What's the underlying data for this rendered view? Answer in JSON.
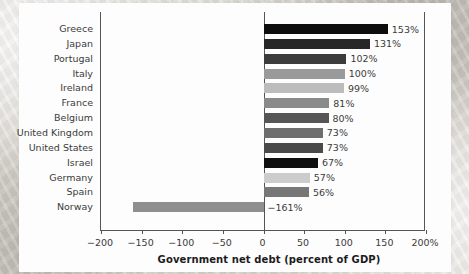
{
  "chart_data": {
    "type": "bar",
    "orientation": "horizontal",
    "title": "",
    "xlabel": "Government net debt (percent of GDP)",
    "ylabel": "",
    "xlim": [
      -200,
      200
    ],
    "xticks": [
      -200,
      -150,
      -100,
      -50,
      0,
      50,
      100,
      150,
      200
    ],
    "xtick_labels": [
      "−200",
      "−150",
      "−100",
      "−50",
      "0",
      "50",
      "100",
      "150",
      "200%"
    ],
    "grid": false,
    "legend": "none",
    "categories": [
      "Greece",
      "Japan",
      "Portugal",
      "Italy",
      "Ireland",
      "France",
      "Belgium",
      "United Kingdom",
      "United States",
      "Israel",
      "Germany",
      "Spain",
      "Norway"
    ],
    "values": [
      153,
      131,
      102,
      100,
      99,
      81,
      80,
      73,
      73,
      67,
      57,
      56,
      -161
    ],
    "value_labels": [
      "153%",
      "131%",
      "102%",
      "100%",
      "99%",
      "81%",
      "80%",
      "73%",
      "73%",
      "67%",
      "57%",
      "56%",
      "−161%"
    ],
    "bar_colors": [
      "#0d0d0d",
      "#272727",
      "#3c3c3c",
      "#9a9a9a",
      "#bcbcbc",
      "#8a8a8a",
      "#565656",
      "#6e6e6e",
      "#4a4a4a",
      "#0f0f0f",
      "#cccccc",
      "#777777",
      "#8f8f8f"
    ],
    "axis_color": "#555555",
    "text_color": "#3b3b3b",
    "plot_background": "#fdfdfd"
  }
}
